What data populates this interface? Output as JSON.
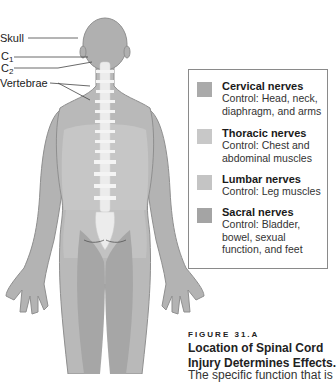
{
  "labels": {
    "skull": "Skull",
    "c1_main": "C",
    "c1_sub": "1",
    "c2_main": "C",
    "c2_sub": "2",
    "vertebrae": "Vertebrae"
  },
  "legend": {
    "items": [
      {
        "title": "Cervical nerves",
        "desc": "Control:  Head, neck, diaphragm, and arms",
        "color": "#aaaaaa"
      },
      {
        "title": "Thoracic nerves",
        "desc": "Control:  Chest and abdominal muscles",
        "color": "#c8c8c8"
      },
      {
        "title": "Lumbar nerves",
        "desc": "Control:  Leg muscles",
        "color": "#c4c4c4"
      },
      {
        "title": "Sacral nerves",
        "desc": "Control:  Bladder, bowel, sexual function, and feet",
        "color": "#a4a4a4"
      }
    ]
  },
  "figure": {
    "number": "FIGURE 31.A",
    "title_line1": "Location of Spinal Cord",
    "title_line2": "Injury Determines Effects.",
    "text_cutoff": "The specific function that is"
  }
}
